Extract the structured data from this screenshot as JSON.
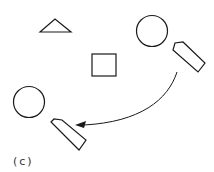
{
  "diagram": {
    "label": "(c)",
    "colors": {
      "stroke": "#1a1a1a",
      "background": "#ffffff",
      "label": "#333333"
    },
    "shapes": [
      {
        "type": "triangle",
        "name": "landmark-triangle"
      },
      {
        "type": "square",
        "name": "landmark-square"
      },
      {
        "type": "circle",
        "name": "object-circle-start"
      },
      {
        "type": "pentagon-arrow",
        "name": "agent-start"
      },
      {
        "type": "circle",
        "name": "object-circle-end"
      },
      {
        "type": "pentagon-arrow",
        "name": "agent-end"
      }
    ],
    "connector": {
      "type": "curved-arrow",
      "from": "agent-start",
      "to": "agent-end"
    }
  }
}
